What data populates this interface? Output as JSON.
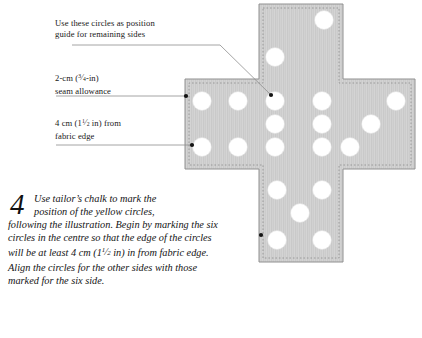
{
  "document": {
    "type": "craft-instruction-illustration",
    "page_background": "#ffffff"
  },
  "callouts": [
    {
      "name": "position-guide-callout",
      "line1": "Use these circles as position",
      "line2": "guide for remaining sides",
      "x": 55,
      "y": 18
    },
    {
      "name": "seam-allowance-callout",
      "line1_prefix": "2-cm (",
      "line1_frac_num": "3",
      "line1_frac_den": "4",
      "line1_suffix": "-in)",
      "line2": "seam allowance",
      "x": 55,
      "y": 72
    },
    {
      "name": "fabric-edge-callout",
      "line1_prefix": "4 cm (1",
      "line1_frac_num": "1",
      "line1_frac_den": "2",
      "line1_suffix": " in) from",
      "line2": "fabric edge",
      "x": 55,
      "y": 117
    }
  ],
  "step": {
    "number": "4",
    "line1": "Use tailor’s chalk to mark the",
    "line2": "position of the yellow circles,",
    "line3": "following the illustration. Begin by",
    "line4": "marking the six circles in the centre so",
    "line5": "that the edge of the circles will be at least",
    "line6_prefix": "4 cm (1",
    "line6_frac_num": "1",
    "line6_frac_den": "2",
    "line6_suffix": " in) in from fabric edge. Align",
    "line7": "the circles for the other sides with those",
    "line8": "marked for the six side."
  },
  "fabric": {
    "name": "cross-shaped-fabric-panel",
    "fill_color": "#c9c9c9",
    "fill_color_light": "#d5d5d5",
    "outline_color": "#8a8a8a",
    "seam_line_color": "#9a9a9a",
    "circle_color": "#ffffff",
    "circle_radius": 9.0,
    "geometry": {
      "left_arm_x": 185,
      "arm_top_y": 79,
      "arm_bottom_y": 169,
      "right_arm_x": 415,
      "vertical_left_x": 259,
      "vertical_right_x": 343,
      "top_y": 4,
      "bottom_y": 262
    },
    "circles": [
      {
        "cx": 324,
        "cy": 20,
        "group": "top-arm"
      },
      {
        "cx": 275,
        "cy": 57,
        "group": "top-arm"
      },
      {
        "cx": 202,
        "cy": 101,
        "group": "left-arm"
      },
      {
        "cx": 238,
        "cy": 101,
        "group": "left-arm"
      },
      {
        "cx": 202,
        "cy": 147,
        "group": "left-arm"
      },
      {
        "cx": 238,
        "cy": 147,
        "group": "left-arm"
      },
      {
        "cx": 275,
        "cy": 101,
        "group": "centre-six"
      },
      {
        "cx": 322,
        "cy": 101,
        "group": "centre-six"
      },
      {
        "cx": 275,
        "cy": 124,
        "group": "centre-six"
      },
      {
        "cx": 322,
        "cy": 124,
        "group": "centre-six"
      },
      {
        "cx": 275,
        "cy": 147,
        "group": "centre-six"
      },
      {
        "cx": 322,
        "cy": 147,
        "group": "centre-six"
      },
      {
        "cx": 396,
        "cy": 101,
        "group": "right-arm"
      },
      {
        "cx": 371,
        "cy": 124,
        "group": "right-arm"
      },
      {
        "cx": 350,
        "cy": 147,
        "group": "right-arm"
      },
      {
        "cx": 277,
        "cy": 190,
        "group": "bottom-arm"
      },
      {
        "cx": 322,
        "cy": 190,
        "group": "bottom-arm"
      },
      {
        "cx": 300,
        "cy": 213,
        "group": "bottom-arm"
      },
      {
        "cx": 277,
        "cy": 240,
        "group": "bottom-arm"
      },
      {
        "cx": 322,
        "cy": 240,
        "group": "bottom-arm"
      }
    ],
    "marker_dots": [
      {
        "name": "position-guide-marker",
        "x": 271,
        "y": 95
      },
      {
        "name": "seam-allowance-marker",
        "x": 186,
        "y": 96
      },
      {
        "name": "fabric-edge-marker",
        "x": 192,
        "y": 145
      },
      {
        "name": "bottom-arm-marker",
        "x": 261,
        "y": 235
      }
    ],
    "leader_lines": [
      {
        "name": "position-guide-leader",
        "x1": 72,
        "y1": 45,
        "x2": 220,
        "y2": 45,
        "x3": 271,
        "y3": 95
      },
      {
        "name": "seam-allowance-leader",
        "x1": 56,
        "y1": 96,
        "x2": 186,
        "y2": 96
      },
      {
        "name": "fabric-edge-leader",
        "x1": 56,
        "y1": 145,
        "x2": 192,
        "y2": 145
      }
    ]
  }
}
